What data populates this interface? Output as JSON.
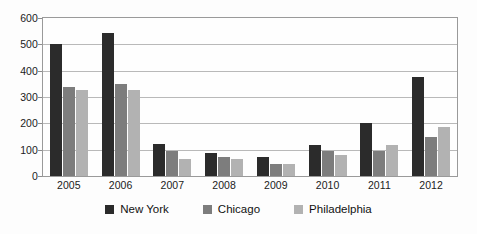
{
  "chart_data": {
    "type": "bar",
    "title": "",
    "subtitle": "",
    "xlabel": "",
    "ylabel": "",
    "categories": [
      "2005",
      "2006",
      "2007",
      "2008",
      "2009",
      "2010",
      "2011",
      "2012"
    ],
    "series": [
      {
        "name": "New York",
        "color": "#2b2b2b",
        "values": [
          500,
          542,
          121,
          86,
          72,
          117,
          203,
          375
        ]
      },
      {
        "name": "Chicago",
        "color": "#7d7d7d",
        "values": [
          337,
          348,
          96,
          71,
          47,
          95,
          95,
          150
        ]
      },
      {
        "name": "Philadelphia",
        "color": "#b2b2b2",
        "values": [
          327,
          327,
          63,
          66,
          47,
          78,
          116,
          188
        ]
      }
    ],
    "ylim": [
      0,
      600
    ],
    "yticks": [
      0,
      100,
      200,
      300,
      400,
      500,
      600
    ],
    "ytick_labels": [
      "0",
      "100",
      "200",
      "300",
      "400",
      "500",
      "600"
    ],
    "grid": true,
    "grid_axis": "y",
    "legend_position": "bottom-center",
    "legend_entries": [
      "New York",
      "Chicago",
      "Philadelphia"
    ],
    "annotations": []
  }
}
